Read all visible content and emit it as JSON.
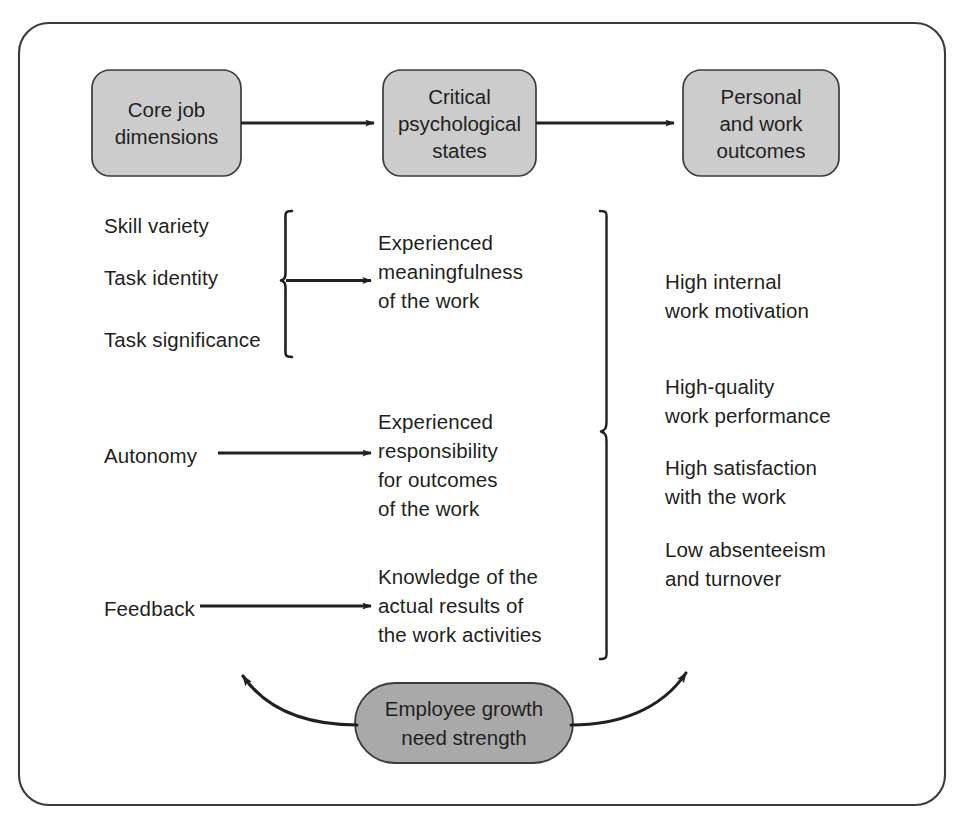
{
  "figure": {
    "border_color": "#3b3b3b",
    "box_fill": "#cccccc",
    "oval_fill": "#a9a9a9",
    "stroke_color": "#231f20",
    "text_color": "#231f20"
  },
  "stages": [
    {
      "id": "core-job-dimensions",
      "label": "Core job\ndimensions"
    },
    {
      "id": "critical-psychological-states",
      "label": "Critical\npsychological\nstates"
    },
    {
      "id": "personal-and-work-outcomes",
      "label": "Personal\nand work\noutcomes"
    }
  ],
  "core_job_dimensions": [
    {
      "id": "skill-variety",
      "label": "Skill variety"
    },
    {
      "id": "task-identity",
      "label": "Task identity"
    },
    {
      "id": "task-significance",
      "label": "Task significance"
    },
    {
      "id": "autonomy",
      "label": "Autonomy"
    },
    {
      "id": "feedback",
      "label": "Feedback"
    }
  ],
  "psychological_states": [
    {
      "id": "experienced-meaningfulness",
      "label": "Experienced\nmeaningfulness\nof the work"
    },
    {
      "id": "experienced-responsibility",
      "label": "Experienced\nresponsibility\nfor outcomes\nof the work"
    },
    {
      "id": "knowledge-of-results",
      "label": "Knowledge of the\nactual results of\nthe work activities"
    }
  ],
  "outcomes": [
    {
      "id": "high-internal-work-motivation",
      "label": "High internal\nwork motivation"
    },
    {
      "id": "high-quality-work-performance",
      "label": "High-quality\nwork performance"
    },
    {
      "id": "high-satisfaction-with-the-work",
      "label": "High satisfaction\nwith the work"
    },
    {
      "id": "low-absenteeism-and-turnover",
      "label": "Low absenteeism\nand turnover"
    }
  ],
  "moderator": {
    "id": "employee-growth-need-strength",
    "label": "Employee growth\nneed strength"
  },
  "connectors": [
    {
      "id": "arrow-dimensions-to-states",
      "from": "core-job-dimensions",
      "to": "critical-psychological-states",
      "type": "arrow"
    },
    {
      "id": "arrow-states-to-outcomes",
      "from": "critical-psychological-states",
      "to": "personal-and-work-outcomes",
      "type": "arrow"
    },
    {
      "id": "brace-skill-identity-significance",
      "type": "brace",
      "groups": [
        "skill-variety",
        "task-identity",
        "task-significance"
      ],
      "to": "experienced-meaningfulness"
    },
    {
      "id": "arrow-autonomy-to-responsibility",
      "from": "autonomy",
      "to": "experienced-responsibility",
      "type": "arrow"
    },
    {
      "id": "arrow-feedback-to-knowledge",
      "from": "feedback",
      "to": "knowledge-of-results",
      "type": "arrow"
    },
    {
      "id": "brace-states-to-outcomes",
      "type": "brace",
      "groups": [
        "experienced-meaningfulness",
        "experienced-responsibility",
        "knowledge-of-results"
      ]
    },
    {
      "id": "curve-growth-need-to-states",
      "from": "employee-growth-need-strength",
      "type": "curved-arrow"
    },
    {
      "id": "curve-growth-need-to-outcomes",
      "from": "employee-growth-need-strength",
      "type": "curved-arrow"
    }
  ]
}
